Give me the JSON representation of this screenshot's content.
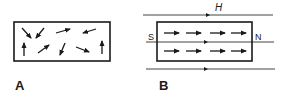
{
  "figure": {
    "panels": [
      {
        "id": "A",
        "label": "A",
        "description": "Unmagnetized material: randomly oriented magnetic domains",
        "box": {
          "x": 14,
          "y": 22,
          "width": 96,
          "height": 39
        },
        "domain_arrows": [
          {
            "x1": 22,
            "y1": 28,
            "x2": 31,
            "y2": 38
          },
          {
            "x1": 44,
            "y1": 28,
            "x2": 36,
            "y2": 38
          },
          {
            "x1": 56,
            "y1": 33,
            "x2": 70,
            "y2": 29
          },
          {
            "x1": 96,
            "y1": 29,
            "x2": 83,
            "y2": 33
          },
          {
            "x1": 24,
            "y1": 56,
            "x2": 24,
            "y2": 43
          },
          {
            "x1": 38,
            "y1": 53,
            "x2": 49,
            "y2": 45
          },
          {
            "x1": 65,
            "y1": 43,
            "x2": 60,
            "y2": 55
          },
          {
            "x1": 76,
            "y1": 47,
            "x2": 89,
            "y2": 52
          },
          {
            "x1": 102,
            "y1": 54,
            "x2": 102,
            "y2": 41
          }
        ]
      },
      {
        "id": "B",
        "label": "B",
        "description": "Magnetized material: domains aligned with external field H",
        "box": {
          "x": 157,
          "y": 22,
          "width": 95,
          "height": 39
        },
        "south_pole_label": "S",
        "north_pole_label": "N",
        "field_label": "H",
        "field_lines": [
          {
            "y": 15,
            "x1": 143,
            "x2": 273,
            "marker_x": 208
          },
          {
            "y": 42,
            "x1": 146,
            "x2": 274,
            "marker_x": 206
          },
          {
            "y": 69,
            "x1": 146,
            "x2": 275,
            "marker_x": 206
          }
        ],
        "domain_arrows": [
          {
            "x1": 164,
            "y1": 33,
            "x2": 179,
            "y2": 33
          },
          {
            "x1": 186,
            "y1": 33,
            "x2": 201,
            "y2": 33
          },
          {
            "x1": 210,
            "y1": 33,
            "x2": 225,
            "y2": 33
          },
          {
            "x1": 231,
            "y1": 33,
            "x2": 246,
            "y2": 33
          },
          {
            "x1": 164,
            "y1": 51,
            "x2": 179,
            "y2": 51
          },
          {
            "x1": 186,
            "y1": 51,
            "x2": 201,
            "y2": 51
          },
          {
            "x1": 210,
            "y1": 51,
            "x2": 225,
            "y2": 51
          },
          {
            "x1": 231,
            "y1": 51,
            "x2": 246,
            "y2": 51
          }
        ]
      }
    ],
    "colors": {
      "ink": "#1a1a1a",
      "line": "#444444",
      "background": "#ffffff"
    }
  }
}
